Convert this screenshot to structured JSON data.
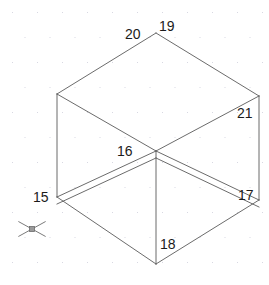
{
  "canvas": {
    "width": 269,
    "height": 285,
    "background": "#ffffff",
    "line_color": "#5a5a5a",
    "label_color": "#1b1b1b",
    "grid_dot_color": "#d8d8e2"
  },
  "grid": {
    "name": "dot-grid",
    "spacing_x": 25,
    "spacing_y": 25,
    "offset_x": 12,
    "offset_y": 12,
    "dot_size": 1
  },
  "drawing": {
    "type": "isometric-cube-wireframe",
    "description": "Isometric open box with labelled vertices",
    "vertices": [
      {
        "label": "15",
        "x": 57,
        "y": 197,
        "label_x": 33,
        "label_y": 190
      },
      {
        "label": "16",
        "x": 156,
        "y": 151,
        "label_x": 117,
        "label_y": 144
      },
      {
        "label": "17",
        "x": 259,
        "y": 200,
        "label_x": 238,
        "label_y": 188
      },
      {
        "label": "18",
        "x": 156,
        "y": 264,
        "label_x": 160,
        "label_y": 237
      },
      {
        "label": "19",
        "x": 156,
        "y": 33,
        "label_x": 159,
        "label_y": 19
      },
      {
        "label": "20",
        "x": 57,
        "y": 94,
        "label_x": 125,
        "label_y": 27
      },
      {
        "label": "21",
        "x": 259,
        "y": 96,
        "label_x": 237,
        "label_y": 106
      }
    ],
    "edges": [
      {
        "name": "top-left-back",
        "from": "20",
        "to": "19"
      },
      {
        "name": "top-right-back",
        "from": "19",
        "to": "21"
      },
      {
        "name": "top-left-front",
        "from": "20",
        "to": "16"
      },
      {
        "name": "top-right-front",
        "from": "16",
        "to": "21"
      },
      {
        "name": "vertical-left",
        "from": "20",
        "to": "15"
      },
      {
        "name": "vertical-right",
        "from": "21",
        "to": "17"
      },
      {
        "name": "vertical-center",
        "from": "16",
        "to": "18"
      },
      {
        "name": "bottom-left-front",
        "from": "15",
        "to": "18"
      },
      {
        "name": "bottom-right-front",
        "from": "18",
        "to": "17"
      },
      {
        "name": "floor-left-inner",
        "from": "15",
        "to": "16"
      },
      {
        "name": "floor-right-inner",
        "from": "16",
        "to": "17"
      }
    ]
  },
  "cursor": {
    "name": "crosshair-cursor",
    "x": 32,
    "y": 229,
    "arm_length": 22,
    "pickbox_size": 5
  }
}
